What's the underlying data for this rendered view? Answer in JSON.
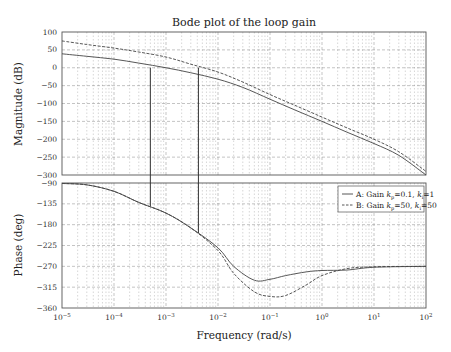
{
  "chart_data": [
    {
      "type": "line",
      "panel": "magnitude",
      "title": "Bode plot of the loop gain",
      "xlabel": "Frequency  (rad/s)",
      "ylabel": "Magnitude (dB)",
      "xscale": "log",
      "xlim": [
        1e-05,
        100
      ],
      "ylim": [
        -300,
        100
      ],
      "yticks": [
        100,
        50,
        0,
        -50,
        -100,
        -150,
        -200,
        -250,
        -300
      ],
      "ytick_labels": [
        "100",
        "50",
        "0",
        "−50",
        "−100",
        "−150",
        "−200",
        "−250",
        "−300"
      ],
      "grid": true,
      "x": [
        1e-05,
        3e-05,
        0.0001,
        0.0003,
        0.001,
        0.003,
        0.01,
        0.03,
        0.1,
        0.3,
        1,
        3,
        10,
        30,
        100
      ],
      "series": [
        {
          "name": "A: Gain kp=0.1, ki=1",
          "style": "solid",
          "values": [
            39,
            32,
            24,
            13,
            0,
            -14,
            -32,
            -55,
            -88,
            -118,
            -150,
            -180,
            -212,
            -245,
            -300
          ]
        },
        {
          "name": "B: Gain kp=50, ki=50",
          "style": "dashed",
          "values": [
            75,
            65,
            55,
            44,
            30,
            10,
            -12,
            -40,
            -75,
            -105,
            -138,
            -168,
            -200,
            -235,
            -290
          ]
        }
      ],
      "annotations": [
        {
          "type": "vline",
          "x": 0.0005,
          "from_db": 0,
          "to_phase_deg": -140,
          "label": "A crossover"
        },
        {
          "type": "vline",
          "x": 0.0042,
          "from_db": 0,
          "to_phase_deg": -198,
          "label": "B crossover"
        }
      ]
    },
    {
      "type": "line",
      "panel": "phase",
      "xlabel": "Frequency  (rad/s)",
      "ylabel": "Phase (deg)",
      "xscale": "log",
      "xlim": [
        1e-05,
        100
      ],
      "ylim": [
        -360,
        -90
      ],
      "yticks": [
        -90,
        -135,
        -180,
        -225,
        -270,
        -315,
        -360
      ],
      "ytick_labels": [
        "−90",
        "−135",
        "−180",
        "−225",
        "−270",
        "−315",
        "−360"
      ],
      "xtick_labels": [
        "10−5",
        "10−4",
        "10−3",
        "10−2",
        "10−1",
        "100",
        "101",
        "102"
      ],
      "grid": true,
      "legend_position": "upper right",
      "x": [
        1e-05,
        3e-05,
        0.0001,
        0.0003,
        0.001,
        0.003,
        0.01,
        0.02,
        0.05,
        0.1,
        0.2,
        0.5,
        1,
        3,
        10,
        100
      ],
      "series": [
        {
          "name": "A: Gain kp=0.1, ki=1",
          "style": "solid",
          "values": [
            -91,
            -94,
            -108,
            -132,
            -155,
            -187,
            -230,
            -270,
            -300,
            -298,
            -290,
            -282,
            -279,
            -278,
            -272,
            -270
          ]
        },
        {
          "name": "B: Gain kp=50, ki=50",
          "style": "dashed",
          "values": [
            -91,
            -94,
            -108,
            -132,
            -155,
            -187,
            -236,
            -285,
            -325,
            -335,
            -333,
            -310,
            -290,
            -275,
            -271,
            -270
          ]
        }
      ]
    }
  ],
  "title": "Bode plot of the loop gain",
  "xlabel": "Frequency  (rad/s)",
  "mag_ylabel": "Magnitude (dB)",
  "phase_ylabel": "Phase (deg)",
  "legend": {
    "a": {
      "prefix": "A: Gain ",
      "k1": "k",
      "s1": "p",
      "v1": "=0.1, ",
      "k2": "k",
      "s2": "i",
      "v2": "=1"
    },
    "b": {
      "prefix": "B: Gain ",
      "k1": "k",
      "s1": "p",
      "v1": "=50, ",
      "k2": "k",
      "s2": "i",
      "v2": "=50"
    }
  },
  "xtick_labels": [
    {
      "base": "10",
      "exp": "−5"
    },
    {
      "base": "10",
      "exp": "−4"
    },
    {
      "base": "10",
      "exp": "−3"
    },
    {
      "base": "10",
      "exp": "−2"
    },
    {
      "base": "10",
      "exp": "−1"
    },
    {
      "base": "10",
      "exp": "0"
    },
    {
      "base": "10",
      "exp": "1"
    },
    {
      "base": "10",
      "exp": "2"
    }
  ],
  "mag_ticks": [
    "100",
    "50",
    "0",
    "−50",
    "−100",
    "−150",
    "−200",
    "−250",
    "−300"
  ],
  "phase_ticks": [
    "−90",
    "−135",
    "−180",
    "−225",
    "−270",
    "−315",
    "−360"
  ]
}
